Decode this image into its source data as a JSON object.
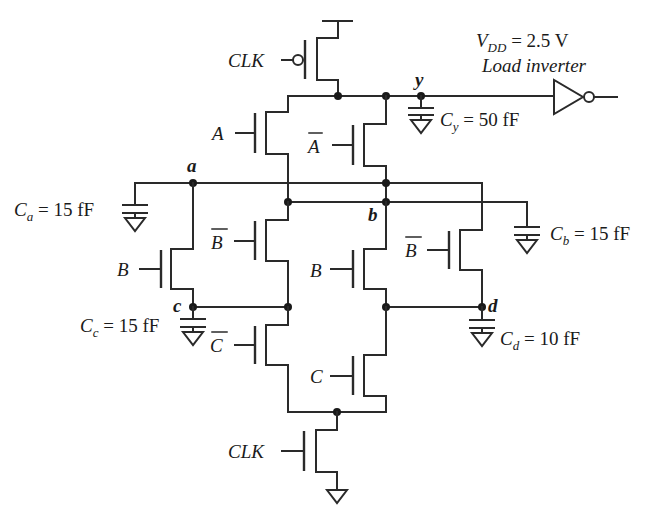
{
  "diagram": {
    "type": "dynamic CMOS (domino/precharge) logic gate schematic",
    "supply": {
      "label_main": "V",
      "label_sub": "DD",
      "label_value": " = 2.5 V"
    },
    "load": {
      "label": "Load inverter"
    },
    "clock": {
      "top_gate_label": "CLK",
      "bottom_gate_label": "CLK"
    },
    "transistors": {
      "precharge_pmos": {
        "gate": "CLK"
      },
      "a": {
        "gate": "A"
      },
      "a_bar": {
        "gate": "A"
      },
      "b_left": {
        "gate": "B"
      },
      "b_bar_mid": {
        "gate": "B"
      },
      "b_mid": {
        "gate": "B"
      },
      "b_bar_right": {
        "gate": "B"
      },
      "c_bar": {
        "gate": "C"
      },
      "c": {
        "gate": "C"
      },
      "evaluate_nmos": {
        "gate": "CLK"
      }
    },
    "nodes": {
      "y": "y",
      "a": "a",
      "b": "b",
      "c": "c",
      "d": "d"
    },
    "capacitors": {
      "cy": {
        "sym": "C",
        "sub": "y",
        "value": " = 50 fF"
      },
      "ca": {
        "sym": "C",
        "sub": "a",
        "value": " = 15 fF"
      },
      "cb": {
        "sym": "C",
        "sub": "b",
        "value": " = 15 fF"
      },
      "cc": {
        "sym": "C",
        "sub": "c",
        "value": " = 15 fF"
      },
      "cd": {
        "sym": "C",
        "sub": "d",
        "value": " = 10 fF"
      }
    }
  }
}
